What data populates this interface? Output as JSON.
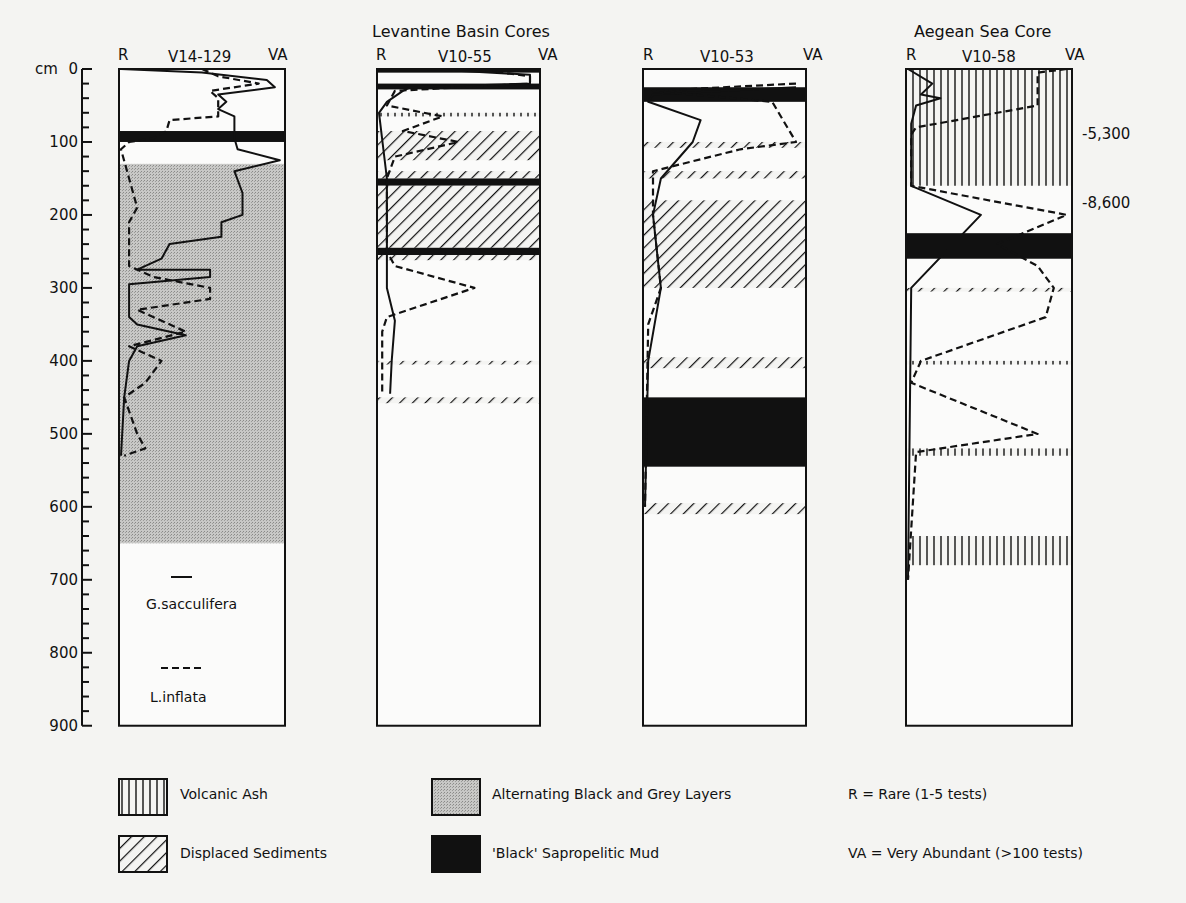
{
  "chart_data": {
    "type": "line",
    "title": "",
    "group_titles": [
      "Levantine Basin Cores",
      "Aegean Sea Core"
    ],
    "ylabel": "cm",
    "y_ticks": [
      0,
      100,
      200,
      300,
      400,
      500,
      600,
      700,
      800,
      900
    ],
    "ylim": [
      0,
      900
    ],
    "x_axis": {
      "left": "R",
      "right": "VA",
      "range": [
        0,
        1
      ]
    },
    "series_legend": [
      {
        "name": "G.sacculifera",
        "style": "solid"
      },
      {
        "name": "L.inflata",
        "style": "dashed"
      }
    ],
    "facies_legend": [
      {
        "name": "Volcanic Ash",
        "pattern": "vertical-lines"
      },
      {
        "name": "Displaced Sediments",
        "pattern": "diagonal-lines"
      },
      {
        "name": "Alternating Black and Grey Layers",
        "pattern": "grey-stipple"
      },
      {
        "name": "'Black' Sapropelitic Mud",
        "pattern": "solid-black"
      }
    ],
    "abundance_key": [
      "R = Rare (1-5 tests)",
      "VA = Very Abundant (>100 tests)"
    ],
    "cores": [
      {
        "id": "V14-129",
        "bottom_cm": 900,
        "layers": [
          {
            "type": "sapropel",
            "top": 85,
            "bottom": 100
          },
          {
            "type": "alternating",
            "top": 130,
            "bottom": 650
          }
        ],
        "G_sacculifera": [
          [
            0,
            0
          ],
          [
            5,
            0.5
          ],
          [
            15,
            0.9
          ],
          [
            25,
            0.95
          ],
          [
            35,
            0.6
          ],
          [
            45,
            0.65
          ],
          [
            55,
            0.6
          ],
          [
            65,
            0.7
          ],
          [
            85,
            0.7
          ],
          [
            95,
            0.7
          ],
          [
            110,
            0.72
          ],
          [
            125,
            0.98
          ],
          [
            140,
            0.7
          ],
          [
            170,
            0.75
          ],
          [
            200,
            0.75
          ],
          [
            210,
            0.62
          ],
          [
            230,
            0.62
          ],
          [
            240,
            0.3
          ],
          [
            260,
            0.25
          ],
          [
            275,
            0.1
          ],
          [
            275,
            0.55
          ],
          [
            285,
            0.55
          ],
          [
            295,
            0.05
          ],
          [
            310,
            0.05
          ],
          [
            340,
            0.05
          ],
          [
            350,
            0.1
          ],
          [
            365,
            0.4
          ],
          [
            380,
            0.1
          ],
          [
            400,
            0.05
          ],
          [
            450,
            0.02
          ],
          [
            530,
            0
          ]
        ],
        "L_inflata": [
          [
            0,
            0.5
          ],
          [
            10,
            0.6
          ],
          [
            20,
            0.85
          ],
          [
            30,
            0.55
          ],
          [
            40,
            0.6
          ],
          [
            65,
            0.6
          ],
          [
            70,
            0.3
          ],
          [
            85,
            0.28
          ],
          [
            95,
            0.2
          ],
          [
            100,
            0.05
          ],
          [
            110,
            0
          ],
          [
            150,
            0.05
          ],
          [
            190,
            0.1
          ],
          [
            210,
            0.05
          ],
          [
            270,
            0.05
          ],
          [
            285,
            0.2
          ],
          [
            300,
            0.55
          ],
          [
            315,
            0.55
          ],
          [
            330,
            0.1
          ],
          [
            360,
            0.4
          ],
          [
            380,
            0.05
          ],
          [
            400,
            0.25
          ],
          [
            430,
            0.15
          ],
          [
            450,
            0.02
          ],
          [
            500,
            0.1
          ],
          [
            520,
            0.15
          ],
          [
            530,
            0.02
          ]
        ]
      },
      {
        "id": "V10-55",
        "bottom_cm": 900,
        "layers": [
          {
            "type": "sapropel",
            "top": 0,
            "bottom": 5
          },
          {
            "type": "sapropel",
            "top": 20,
            "bottom": 28
          },
          {
            "type": "ash-thin",
            "top": 60,
            "bottom": 65
          },
          {
            "type": "displaced",
            "top": 85,
            "bottom": 125
          },
          {
            "type": "displaced",
            "top": 140,
            "bottom": 150
          },
          {
            "type": "sapropel",
            "top": 150,
            "bottom": 160
          },
          {
            "type": "displaced",
            "top": 160,
            "bottom": 245
          },
          {
            "type": "sapropel",
            "top": 245,
            "bottom": 255
          },
          {
            "type": "displaced-thin",
            "top": 255,
            "bottom": 262
          },
          {
            "type": "displaced-thin",
            "top": 400,
            "bottom": 405
          },
          {
            "type": "displaced-thin",
            "top": 450,
            "bottom": 458
          }
        ],
        "G_sacculifera": [
          [
            0,
            0.3
          ],
          [
            8,
            0.95
          ],
          [
            20,
            0.95
          ],
          [
            25,
            0.2
          ],
          [
            30,
            0.15
          ],
          [
            45,
            0.05
          ],
          [
            60,
            0
          ],
          [
            150,
            0.05
          ],
          [
            250,
            0.05
          ],
          [
            300,
            0.05
          ],
          [
            345,
            0.1
          ],
          [
            400,
            0.08
          ],
          [
            445,
            0.07
          ]
        ],
        "L_inflata": [
          [
            0,
            0.6
          ],
          [
            10,
            0.95
          ],
          [
            20,
            0.95
          ],
          [
            30,
            0.1
          ],
          [
            50,
            0.05
          ],
          [
            65,
            0.4
          ],
          [
            85,
            0.15
          ],
          [
            100,
            0.5
          ],
          [
            120,
            0.1
          ],
          [
            150,
            0.05
          ],
          [
            250,
            0.05
          ],
          [
            270,
            0.1
          ],
          [
            300,
            0.6
          ],
          [
            340,
            0.05
          ],
          [
            360,
            0.02
          ],
          [
            445,
            0.02
          ]
        ]
      },
      {
        "id": "V10-53",
        "bottom_cm": 900,
        "layers": [
          {
            "type": "sapropel",
            "top": 25,
            "bottom": 45
          },
          {
            "type": "displaced-thin",
            "top": 100,
            "bottom": 108
          },
          {
            "type": "displaced-thin",
            "top": 140,
            "bottom": 150
          },
          {
            "type": "displaced",
            "top": 180,
            "bottom": 300
          },
          {
            "type": "displaced-thin",
            "top": 395,
            "bottom": 410
          },
          {
            "type": "sapropel",
            "top": 450,
            "bottom": 545
          },
          {
            "type": "displaced-thin",
            "top": 595,
            "bottom": 610
          }
        ],
        "G_sacculifera": [
          [
            25,
            0.95
          ],
          [
            35,
            0.05
          ],
          [
            45,
            0.02
          ],
          [
            70,
            0.35
          ],
          [
            100,
            0.3
          ],
          [
            150,
            0.1
          ],
          [
            200,
            0.05
          ],
          [
            300,
            0.1
          ],
          [
            400,
            0.02
          ],
          [
            600,
            0
          ]
        ],
        "L_inflata": [
          [
            20,
            0.95
          ],
          [
            30,
            0.05
          ],
          [
            45,
            0.8
          ],
          [
            100,
            0.95
          ],
          [
            110,
            0.6
          ],
          [
            140,
            0.05
          ],
          [
            200,
            0.05
          ],
          [
            300,
            0.1
          ],
          [
            350,
            0.02
          ],
          [
            600,
            0
          ]
        ]
      },
      {
        "id": "V10-58",
        "bottom_cm": 900,
        "age_labels": [
          {
            "depth": 55,
            "label": "-5,300"
          },
          {
            "depth": 160,
            "label": "-8,600"
          }
        ],
        "layers": [
          {
            "type": "ash",
            "top": 0,
            "bottom": 160
          },
          {
            "type": "sapropel",
            "top": 225,
            "bottom": 260
          },
          {
            "type": "displaced-thin",
            "top": 300,
            "bottom": 305
          },
          {
            "type": "ash-thin",
            "top": 400,
            "bottom": 405
          },
          {
            "type": "ash-thin",
            "top": 520,
            "bottom": 530
          },
          {
            "type": "ash",
            "top": 640,
            "bottom": 680
          }
        ],
        "G_sacculifera": [
          [
            0,
            0
          ],
          [
            20,
            0.15
          ],
          [
            35,
            0.08
          ],
          [
            40,
            0.2
          ],
          [
            50,
            0.05
          ],
          [
            75,
            0.02
          ],
          [
            160,
            0.02
          ],
          [
            200,
            0.45
          ],
          [
            300,
            0.02
          ],
          [
            700,
            0
          ]
        ],
        "L_inflata": [
          [
            0,
            0.98
          ],
          [
            5,
            0.8
          ],
          [
            50,
            0.8
          ],
          [
            80,
            0.05
          ],
          [
            90,
            0.02
          ],
          [
            160,
            0.02
          ],
          [
            200,
            0.98
          ],
          [
            240,
            0.55
          ],
          [
            270,
            0.8
          ],
          [
            300,
            0.9
          ],
          [
            340,
            0.85
          ],
          [
            400,
            0.08
          ],
          [
            430,
            0.02
          ],
          [
            500,
            0.8
          ],
          [
            525,
            0.05
          ],
          [
            700,
            0
          ]
        ]
      }
    ]
  },
  "labels": {
    "group_levantine": "Levantine Basin Cores",
    "group_aegean": "Aegean Sea Core",
    "cm": "cm",
    "r": "R",
    "va": "VA",
    "core_1": "V14-129",
    "core_2": "V10-55",
    "core_3": "V10-53",
    "core_4": "V10-58",
    "age_1": "-5,300",
    "age_2": "-8,600",
    "legend_solid": "G.sacculifera",
    "legend_dashed": "L.inflata",
    "facies_ash": "Volcanic Ash",
    "facies_displaced": "Displaced Sediments",
    "facies_alternating": "Alternating Black and Grey Layers",
    "facies_sapropel": "'Black' Sapropelitic Mud",
    "key_r": "R = Rare (1-5 tests)",
    "key_va": "VA = Very Abundant (>100 tests)"
  },
  "ticks": [
    "0",
    "100",
    "200",
    "300",
    "400",
    "500",
    "600",
    "700",
    "800",
    "900"
  ]
}
